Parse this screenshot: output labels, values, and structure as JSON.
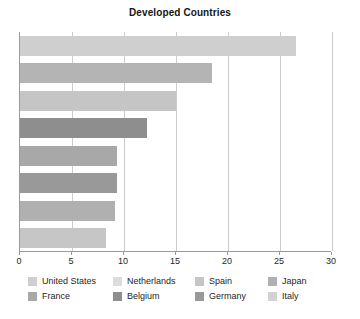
{
  "chart_data": {
    "type": "bar",
    "orientation": "horizontal",
    "title": "Developed Countries",
    "xlabel": "",
    "ylabel": "",
    "xlim": [
      0,
      30
    ],
    "xticks": [
      0,
      5,
      10,
      15,
      20,
      25,
      30
    ],
    "xtick_labels": [
      "0",
      "5",
      "10",
      "15",
      "20",
      "25",
      "30"
    ],
    "grid": true,
    "grid_axis": "x",
    "legend_position": "bottom",
    "categories": [
      "United States",
      "Netherlands",
      "Spain",
      "Japan",
      "France",
      "Belgium",
      "Germany",
      "Italy"
    ],
    "values": [
      26.5,
      18.5,
      15,
      12.2,
      9.3,
      9.3,
      9.1,
      8.3
    ],
    "colors": [
      "#cfcfcf",
      "#b4b4b4",
      "#c5c5c5",
      "#8e8e8e",
      "#a8a8a8",
      "#999999",
      "#b0b0b0",
      "#c6c6c6"
    ],
    "bars": [
      {
        "label": "United States",
        "value": 26.5,
        "color": "#cfcfcf"
      },
      {
        "label": "Netherlands",
        "value": 18.5,
        "color": "#b4b4b4"
      },
      {
        "label": "Spain",
        "value": 15,
        "color": "#c5c5c5"
      },
      {
        "label": "Japan",
        "value": 12.2,
        "color": "#8e8e8e"
      },
      {
        "label": "France",
        "value": 9.3,
        "color": "#a8a8a8"
      },
      {
        "label": "Belgium",
        "value": 9.3,
        "color": "#999999"
      },
      {
        "label": "Germany",
        "value": 9.1,
        "color": "#b0b0b0"
      },
      {
        "label": "Italy",
        "value": 8.3,
        "color": "#c6c6c6"
      }
    ]
  },
  "legend": {
    "rows": [
      [
        {
          "label": "United States",
          "color": "#cfcfcf"
        },
        {
          "label": "Netherlands",
          "color": "#dcdcdc"
        },
        {
          "label": "Spain",
          "color": "#c5c5c5"
        },
        {
          "label": "Japan",
          "color": "#b0b0b0"
        }
      ],
      [
        {
          "label": "France",
          "color": "#a8a8a8"
        },
        {
          "label": "Belgium",
          "color": "#8e8e8e"
        },
        {
          "label": "Germany",
          "color": "#999999"
        },
        {
          "label": "Italy",
          "color": "#d2d2d2"
        }
      ]
    ]
  },
  "axis": {
    "line_color": "#9a9a9a",
    "grid_color": "#cccccc"
  }
}
